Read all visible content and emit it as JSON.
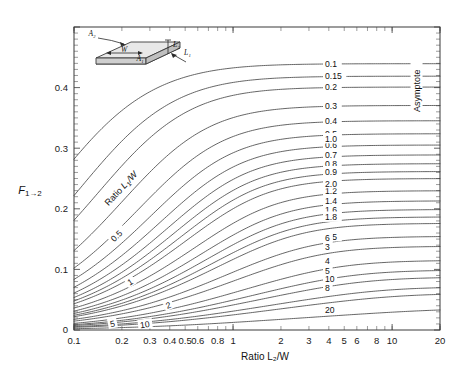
{
  "chart_data": {
    "type": "line",
    "title": "",
    "xlabel": "Ratio L₂/W",
    "ylabel": "F₁→₂",
    "xscale": "log",
    "yscale": "linear",
    "xlim": [
      0.1,
      20
    ],
    "ylim": [
      0,
      0.5
    ],
    "grid": false,
    "legend_position": "inline-curve-labels",
    "xticks": [
      0.1,
      0.2,
      0.3,
      0.4,
      0.5,
      0.6,
      0.8,
      1,
      2,
      3,
      4,
      5,
      6,
      8,
      10,
      20
    ],
    "xticklabels": [
      "0.1",
      "0.2",
      "0.3",
      "0.4",
      "0.5",
      "0.6",
      "0.8",
      "1",
      "2",
      "3",
      "4",
      "5",
      "6",
      "8",
      "10",
      "20"
    ],
    "yticks": [
      0,
      0.1,
      0.2,
      0.3,
      0.4
    ],
    "yticklabels": [
      "0",
      "0.1",
      "0.2",
      "0.3",
      "0.4"
    ],
    "series_parameter_label": "Ratio L₁/W",
    "annotations": [
      {
        "text": "Asymptote",
        "orientation": "vertical",
        "location": "right-edge"
      },
      {
        "text": "Ratio L₁/W",
        "orientation": "rotated",
        "location": "upper-left-curve-band"
      }
    ],
    "series": [
      {
        "name": "0.1",
        "ratio_l1_w": 0.1,
        "label": "0.1",
        "label_side": "right"
      },
      {
        "name": "0.15",
        "ratio_l1_w": 0.15,
        "label": "0.15",
        "label_side": "right"
      },
      {
        "name": "0.2",
        "ratio_l1_w": 0.2,
        "label": "0.2",
        "label_side": "right"
      },
      {
        "name": "0.3",
        "ratio_l1_w": 0.3,
        "label": "0.3",
        "label_side": "right"
      },
      {
        "name": "0.4",
        "ratio_l1_w": 0.4,
        "label": "0.4",
        "label_side": "right"
      },
      {
        "name": "0.5",
        "ratio_l1_w": 0.5,
        "label": "0.5",
        "label_side": "both"
      },
      {
        "name": "0.6",
        "ratio_l1_w": 0.6,
        "label": "0.6",
        "label_side": "right"
      },
      {
        "name": "0.7",
        "ratio_l1_w": 0.7,
        "label": "0.7",
        "label_side": "right"
      },
      {
        "name": "0.8",
        "ratio_l1_w": 0.8,
        "label": "0.8",
        "label_side": "right"
      },
      {
        "name": "0.9",
        "ratio_l1_w": 0.9,
        "label": "0.9",
        "label_side": "right"
      },
      {
        "name": "1.0",
        "ratio_l1_w": 1.0,
        "label": "1.0",
        "label_side": "both",
        "left_label": "1"
      },
      {
        "name": "1.2",
        "ratio_l1_w": 1.2,
        "label": "1.2",
        "label_side": "right"
      },
      {
        "name": "1.4",
        "ratio_l1_w": 1.4,
        "label": "1.4",
        "label_side": "right"
      },
      {
        "name": "1.6",
        "ratio_l1_w": 1.6,
        "label": "1.6",
        "label_side": "right"
      },
      {
        "name": "1.8",
        "ratio_l1_w": 1.8,
        "label": "1.8",
        "label_side": "right"
      },
      {
        "name": "2.0",
        "ratio_l1_w": 2.0,
        "label": "2.0",
        "label_side": "both",
        "left_label": "2"
      },
      {
        "name": "2.5",
        "ratio_l1_w": 2.5,
        "label": "2.5",
        "label_side": "right"
      },
      {
        "name": "3",
        "ratio_l1_w": 3.0,
        "label": "3",
        "label_side": "right"
      },
      {
        "name": "4",
        "ratio_l1_w": 4.0,
        "label": "4",
        "label_side": "right"
      },
      {
        "name": "5",
        "ratio_l1_w": 5.0,
        "label": "5",
        "label_side": "both"
      },
      {
        "name": "6",
        "ratio_l1_w": 6.0,
        "label": "6",
        "label_side": "right"
      },
      {
        "name": "8",
        "ratio_l1_w": 8.0,
        "label": "8",
        "label_side": "right"
      },
      {
        "name": "10",
        "ratio_l1_w": 10.0,
        "label": "10",
        "label_side": "both"
      },
      {
        "name": "20",
        "ratio_l1_w": 20.0,
        "label": "20",
        "label_side": "right"
      }
    ]
  },
  "inset": {
    "name": "perpendicular-rectangles-diagram",
    "labels": {
      "a1": "A₁",
      "a2": "A₂",
      "w": "W",
      "l1": "L₁",
      "l2": "L₂"
    }
  },
  "axis": {
    "x_title": "Ratio L₂/W",
    "y_title": "F₁→₂"
  }
}
